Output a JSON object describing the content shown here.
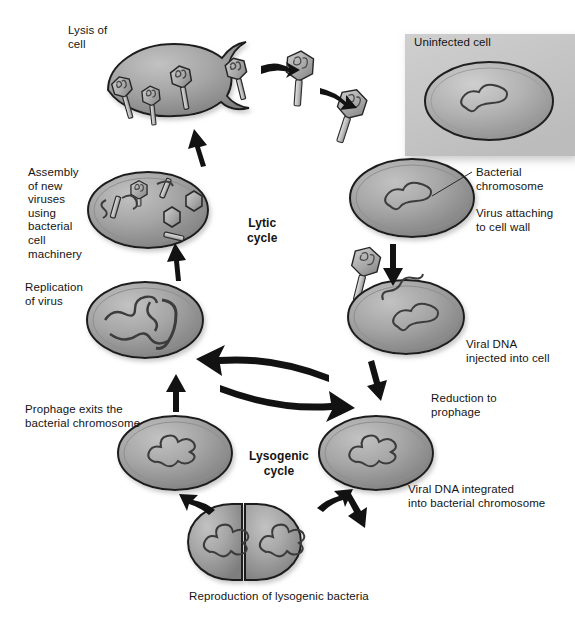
{
  "figure": {
    "background_color": "#ffffff",
    "text_color": "#141414",
    "cell_fill_color": "#9a9a9a",
    "cell_outline_color": "#1c1c1c",
    "inset_background_color": "#c9c9c9",
    "arrow_color": "#121212"
  },
  "cycle_labels": {
    "lytic": "Lytic\ncycle",
    "lysogenic": "Lysogenic\ncycle"
  },
  "labels": [
    {
      "id": "lysis-of-cell",
      "text": "Lysis of\ncell",
      "x": 68,
      "y": 24,
      "align": "left"
    },
    {
      "id": "assembly-of-new-viruses",
      "text": "Assembly\nof new\nviruses\nusing\nbacterial\ncell\nmachinery",
      "x": 28,
      "y": 166,
      "align": "left"
    },
    {
      "id": "replication-of-virus",
      "text": "Replication\nof virus",
      "x": 25,
      "y": 281,
      "align": "left"
    },
    {
      "id": "prophage-exits",
      "text": "Prophage exits the\nbacterial chromosome",
      "x": 25,
      "y": 403,
      "align": "left"
    },
    {
      "id": "uninfected-cell",
      "text": "Uninfected cell",
      "x": 414,
      "y": 36,
      "align": "left"
    },
    {
      "id": "bacterial-chromosome",
      "text": "Bacterial\nchromosome",
      "x": 476,
      "y": 166,
      "align": "left"
    },
    {
      "id": "virus-attaching",
      "text": "Virus attaching\nto cell wall",
      "x": 476,
      "y": 207,
      "align": "left"
    },
    {
      "id": "viral-dna-injected",
      "text": "Viral DNA\ninjected into cell",
      "x": 466,
      "y": 338,
      "align": "left"
    },
    {
      "id": "reduction-to-prophage",
      "text": "Reduction to\nprophage",
      "x": 431,
      "y": 392,
      "align": "left"
    },
    {
      "id": "viral-dna-integrated",
      "text": "Viral DNA integrated\ninto bacterial chromosome",
      "x": 408,
      "y": 483,
      "align": "left"
    },
    {
      "id": "reproduction-of-lysogenic-bacteria",
      "text": "Reproduction of lysogenic bacteria",
      "x": 189,
      "y": 590,
      "align": "left"
    }
  ],
  "cycle_label_positions": {
    "lytic": {
      "x": 247,
      "y": 216
    },
    "lysogenic": {
      "x": 249,
      "y": 449
    },
    "lytic_id": "lytic-cycle-label",
    "lysogenic_id": "lysogenic-cycle-label"
  },
  "stages": [
    {
      "id": "uninfected-cell-stage",
      "name": "Uninfected cell",
      "cx": 489,
      "cy": 97
    },
    {
      "id": "virus-attaching-stage",
      "name": "Virus attaching to cell wall",
      "cx": 410,
      "cy": 196
    },
    {
      "id": "viral-dna-injected-stage",
      "name": "Viral DNA injected into cell",
      "cx": 404,
      "cy": 314
    },
    {
      "id": "viral-dna-integrated-stage",
      "name": "Viral DNA integrated into bacterial chromosome",
      "cx": 374,
      "cy": 451
    },
    {
      "id": "reproduction-stage",
      "name": "Reproduction of lysogenic bacteria",
      "cx": 288,
      "cy": 543
    },
    {
      "id": "prophage-exit-stage",
      "name": "Prophage exits the bacterial chromosome",
      "cx": 173,
      "cy": 452
    },
    {
      "id": "replication-stage",
      "name": "Replication of virus",
      "cx": 143,
      "cy": 318
    },
    {
      "id": "assembly-stage",
      "name": "Assembly of new viruses",
      "cx": 147,
      "cy": 209
    },
    {
      "id": "lysis-stage",
      "name": "Lysis of cell",
      "cx": 172,
      "cy": 88
    }
  ],
  "virus_particles": [
    {
      "id": "free-phage-top",
      "cx": 300,
      "cy": 66
    },
    {
      "id": "attaching-phage",
      "cx": 352,
      "cy": 104
    },
    {
      "id": "injecting-phage",
      "cx": 366,
      "cy": 264
    }
  ]
}
